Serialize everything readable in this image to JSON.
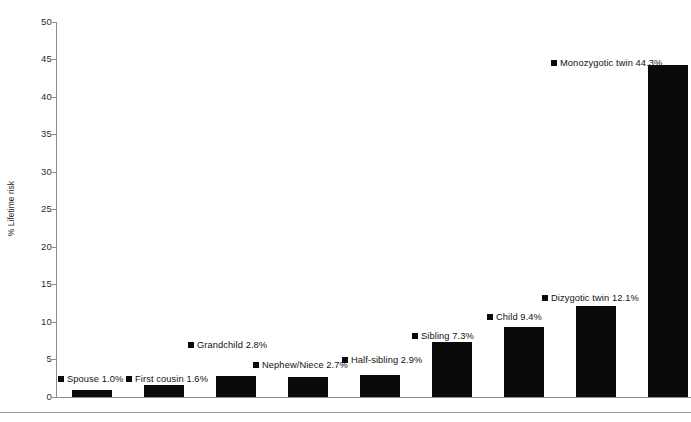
{
  "chart_data": {
    "type": "bar",
    "title": "",
    "xlabel": "",
    "ylabel": "% Lifetime risk",
    "ylim": [
      0,
      50
    ],
    "ytick_step": 5,
    "yticks": [
      "50",
      "45",
      "40",
      "35",
      "30",
      "25",
      "20",
      "15",
      "10",
      "5",
      "0"
    ],
    "grid": false,
    "legend_position": "none",
    "bar_color": "#0a0a0a",
    "categories": [
      "Spouse",
      "First cousin",
      "Grandchild",
      "Nephew/Niece",
      "Half-sibling",
      "Sibling",
      "Child",
      "Dizygotic twin",
      "Monozygotic twin"
    ],
    "values": [
      1.0,
      1.6,
      2.8,
      2.7,
      2.9,
      7.3,
      9.4,
      12.1,
      44.3
    ],
    "bars": [
      {
        "label": "Spouse",
        "value": 1.0,
        "text": "Spouse 1.0%",
        "x": 72,
        "width": 40,
        "label_x": 58,
        "label_y": 374
      },
      {
        "label": "First cousin",
        "value": 1.6,
        "text": "First cousin 1.6%",
        "x": 144,
        "width": 40,
        "label_x": 126,
        "label_y": 374
      },
      {
        "label": "Grandchild",
        "value": 2.8,
        "text": "Grandchild 2.8%",
        "x": 216,
        "width": 40,
        "label_x": 188,
        "label_y": 340
      },
      {
        "label": "Nephew/Niece",
        "value": 2.7,
        "text": "Nephew/Niece 2.7%",
        "x": 288,
        "width": 40,
        "label_x": 253,
        "label_y": 360
      },
      {
        "label": "Half-sibling",
        "value": 2.9,
        "text": "Half-sibling 2.9%",
        "x": 360,
        "width": 40,
        "label_x": 342,
        "label_y": 355
      },
      {
        "label": "Sibling",
        "value": 7.3,
        "text": "Sibling 7.3%",
        "x": 432,
        "width": 40,
        "label_x": 412,
        "label_y": 331
      },
      {
        "label": "Child",
        "value": 9.4,
        "text": "Child 9.4%",
        "x": 504,
        "width": 40,
        "label_x": 487,
        "label_y": 312
      },
      {
        "label": "Dizygotic twin",
        "value": 12.1,
        "text": "Dizygotic twin 12.1%",
        "x": 576,
        "width": 40,
        "label_x": 542,
        "label_y": 293
      },
      {
        "label": "Monozygotic twin",
        "value": 44.3,
        "text": "Monozygotic twin 44.3%",
        "x": 648,
        "width": 40,
        "label_x": 551,
        "label_y": 58
      }
    ]
  }
}
